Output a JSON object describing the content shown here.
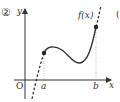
{
  "figure": {
    "number_label": "②",
    "axes": {
      "x_label": "x",
      "y_label": "y",
      "origin_label": "O"
    },
    "function_label": "f(x)",
    "interval": {
      "left_label": "a",
      "right_label": "b"
    },
    "edge_fragment": "(",
    "colors": {
      "ink": "#333333",
      "guide": "#999999",
      "background": "#ffffff"
    }
  }
}
